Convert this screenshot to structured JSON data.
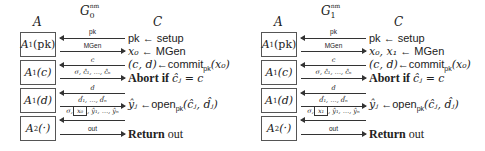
{
  "games": [
    {
      "title": {
        "base": "G",
        "sub": "0",
        "sup": "nm"
      },
      "adversary_label": "A",
      "challenger_label": "C",
      "adversary_boxes": [
        {
          "name": "A",
          "sub": "1",
          "arg": "(pk)"
        },
        {
          "name": "A",
          "sub": "1",
          "arg": "(c)"
        },
        {
          "name": "A",
          "sub": "1",
          "arg": "(d)"
        },
        {
          "name": "A",
          "sub": "2",
          "arg": "(·)"
        }
      ],
      "arrows": [
        {
          "direction": "left",
          "label": "pk"
        },
        {
          "direction": "right",
          "label": "MGen"
        },
        {
          "direction": "left",
          "label": "c"
        },
        {
          "direction": "right",
          "label": "σ, ĉ₁, …, ĉₙ"
        },
        {
          "direction": "left",
          "label": "d"
        },
        {
          "direction": "right",
          "label": "d̂₁, …, d̂ₙ"
        },
        {
          "direction": "left",
          "label_prefix": "σ,",
          "label_boxed": "x₀",
          "label_suffix": ", ŷ₁, …, ŷₙ"
        },
        {
          "direction": "right",
          "label": "out"
        }
      ],
      "challenger_lines": [
        {
          "lhs": "pk",
          "op": "←",
          "rhs": "setup"
        },
        {
          "lhs": "x₀",
          "op": "←",
          "rhs": "MGen"
        },
        {
          "lhs": "(c, d)",
          "op": "←",
          "rhs": "commit",
          "rhs_sub": "pk",
          "rhs_arg": "(x₀)"
        },
        {
          "keyword": "Abort if",
          "expr": "ĉⱼ = c"
        },
        {
          "lhs": "ŷⱼ",
          "op": "←",
          "rhs": "open",
          "rhs_sub": "pk",
          "rhs_arg": "(ĉⱼ, d̂ⱼ)"
        },
        {
          "keyword": "Return",
          "expr": "out"
        }
      ]
    },
    {
      "title": {
        "base": "G",
        "sub": "1",
        "sup": "nm"
      },
      "adversary_label": "A",
      "challenger_label": "C",
      "adversary_boxes": [
        {
          "name": "A",
          "sub": "1",
          "arg": "(pk)"
        },
        {
          "name": "A",
          "sub": "1",
          "arg": "(c)"
        },
        {
          "name": "A",
          "sub": "1",
          "arg": "(d)"
        },
        {
          "name": "A",
          "sub": "2",
          "arg": "(·)"
        }
      ],
      "arrows": [
        {
          "direction": "left",
          "label": "pk"
        },
        {
          "direction": "right",
          "label": "MGen"
        },
        {
          "direction": "left",
          "label": "c"
        },
        {
          "direction": "right",
          "label": "σ, ĉ₁, …, ĉₙ"
        },
        {
          "direction": "left",
          "label": "d"
        },
        {
          "direction": "right",
          "label": "d̂₁, …, d̂ₙ"
        },
        {
          "direction": "left",
          "label_prefix": "σ,",
          "label_boxed": "x₁",
          "label_suffix": ", ŷ₁, …, ŷₙ"
        },
        {
          "direction": "right",
          "label": "out"
        }
      ],
      "challenger_lines": [
        {
          "lhs": "pk",
          "op": "←",
          "rhs": "setup"
        },
        {
          "lhs": "x₀, x₁",
          "op": "←",
          "rhs": "MGen"
        },
        {
          "lhs": "(c, d)",
          "op": "←",
          "rhs": "commit",
          "rhs_sub": "pk",
          "rhs_arg": "(x₀)"
        },
        {
          "keyword": "Abort if",
          "expr": "ĉⱼ = c"
        },
        {
          "lhs": "ŷⱼ",
          "op": "←",
          "rhs": "open",
          "rhs_sub": "pk",
          "rhs_arg": "(ĉⱼ, d̂ⱼ)"
        },
        {
          "keyword": "Return",
          "expr": "out"
        }
      ]
    }
  ]
}
